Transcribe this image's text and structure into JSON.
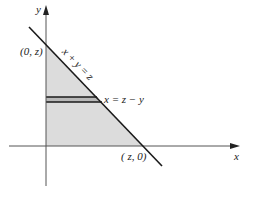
{
  "diagram": {
    "type": "region-plot",
    "axes": {
      "x_label": "x",
      "y_label": "y"
    },
    "points": {
      "y_intercept": "(0, z)",
      "x_intercept": "( z, 0)"
    },
    "line_labels": {
      "diagonal": "x + y = z",
      "strip": "x = z − y"
    },
    "colors": {
      "axis": "#555555",
      "line": "#1a1a1a",
      "shade": "#dcdcdc",
      "strip": "#b8b8b8"
    }
  }
}
